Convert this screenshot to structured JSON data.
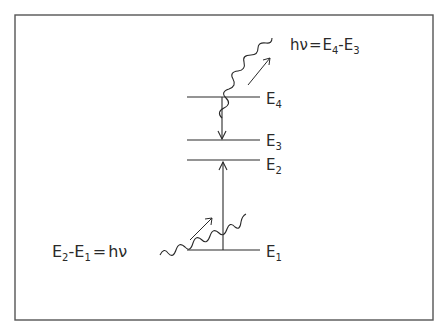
{
  "diagram": {
    "type": "energy-level-diagram",
    "colors": {
      "ink": "#2a2a2a",
      "frame": "#555555",
      "background": "#ffffff"
    },
    "levels": [
      {
        "id": "E1",
        "label": "E",
        "subscript": "1"
      },
      {
        "id": "E2",
        "label": "E",
        "subscript": "2"
      },
      {
        "id": "E3",
        "label": "E",
        "subscript": "3"
      },
      {
        "id": "E4",
        "label": "E",
        "subscript": "4"
      }
    ],
    "transitions": [
      {
        "from": "E1",
        "to": "E2",
        "kind": "absorption",
        "direction": "up"
      },
      {
        "from": "E4",
        "to": "E3",
        "kind": "emission",
        "direction": "down"
      }
    ],
    "photons": {
      "incoming": {
        "equation": {
          "a": "E",
          "a_sub": "2",
          "minus": "-",
          "b": "E",
          "b_sub": "1",
          "eq": "=",
          "rhs": "hν"
        }
      },
      "outgoing": {
        "equation": {
          "lhs": "hν",
          "eq": "=",
          "a": "E",
          "a_sub": "4",
          "minus": "-",
          "b": "E",
          "b_sub": "3"
        }
      }
    }
  }
}
